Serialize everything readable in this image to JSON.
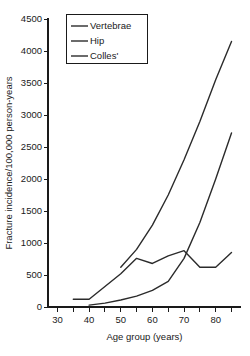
{
  "chart_data": {
    "type": "line",
    "title": "",
    "xlabel": "Age group (years)",
    "ylabel": "Fracture incidence/100,000 person-years",
    "xlim": [
      27,
      88
    ],
    "ylim": [
      0,
      4500
    ],
    "xticks_major": [
      30,
      40,
      50,
      60,
      70,
      80
    ],
    "xtick_labels": [
      "30",
      "40",
      "50",
      "60",
      "70",
      "80"
    ],
    "xticks_minor": [
      35,
      45,
      55,
      65,
      75,
      85
    ],
    "yticks": [
      0,
      500,
      1000,
      1500,
      2000,
      2500,
      3000,
      3500,
      4000,
      4500
    ],
    "ytick_labels": [
      "0",
      "500",
      "1000",
      "1500",
      "2000",
      "2500",
      "3000",
      "3500",
      "4000",
      "4500"
    ],
    "grid": false,
    "legend_position": "top-left",
    "series": [
      {
        "name": "Vertebrae",
        "color": "#2b2b2b",
        "x": [
          50,
          55,
          60,
          65,
          70,
          75,
          80,
          85
        ],
        "values": [
          620,
          900,
          1280,
          1750,
          2300,
          2900,
          3550,
          4150
        ]
      },
      {
        "name": "Hip",
        "color": "#2b2b2b",
        "x": [
          40,
          45,
          50,
          55,
          60,
          65,
          70,
          75,
          80,
          85
        ],
        "values": [
          30,
          60,
          110,
          170,
          260,
          400,
          760,
          1320,
          2000,
          2720
        ]
      },
      {
        "name": "Colles'",
        "color": "#2b2b2b",
        "x": [
          35,
          40,
          45,
          50,
          55,
          60,
          65,
          70,
          75,
          80,
          85
        ],
        "values": [
          120,
          120,
          320,
          520,
          760,
          680,
          800,
          880,
          620,
          620,
          850
        ]
      }
    ]
  },
  "legend": {
    "entries": [
      {
        "label": "Vertebrae"
      },
      {
        "label": "Hip"
      },
      {
        "label": "Colles'"
      }
    ]
  },
  "axes": {
    "x_title": "Age group (years)",
    "y_title": "Fracture incidence/100,000 person-years"
  }
}
